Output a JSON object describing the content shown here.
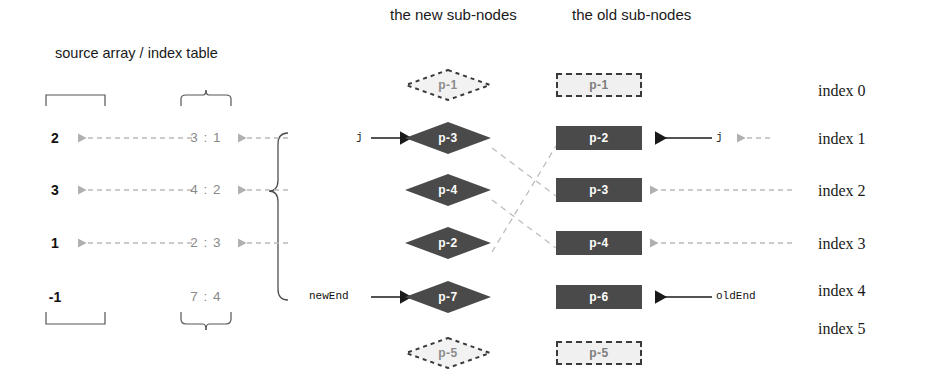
{
  "headers": {
    "new_sub_nodes": "the new sub-nodes",
    "old_sub_nodes": "the old sub-nodes",
    "source_index": "source array  /  index table"
  },
  "source_array": {
    "values": [
      "2",
      "3",
      "1",
      "-1"
    ]
  },
  "index_table": {
    "entries": [
      "3 : 1",
      "4 : 2",
      "2 : 3",
      "7 : 4"
    ]
  },
  "new_nodes": [
    {
      "label": "p-1",
      "state": "ghost"
    },
    {
      "label": "p-3",
      "state": "active"
    },
    {
      "label": "p-4",
      "state": "active"
    },
    {
      "label": "p-2",
      "state": "active"
    },
    {
      "label": "p-7",
      "state": "active"
    },
    {
      "label": "p-5",
      "state": "ghost"
    }
  ],
  "old_nodes": [
    {
      "label": "p-1",
      "state": "ghost"
    },
    {
      "label": "p-2",
      "state": "active"
    },
    {
      "label": "p-3",
      "state": "active"
    },
    {
      "label": "p-4",
      "state": "active"
    },
    {
      "label": "p-6",
      "state": "active"
    },
    {
      "label": "p-5",
      "state": "ghost"
    }
  ],
  "pointers": {
    "new_j": "j",
    "new_end": "newEnd",
    "old_j": "j",
    "old_end": "oldEnd"
  },
  "index_labels": [
    "index 0",
    "index 1",
    "index 2",
    "index 3",
    "index 4",
    "index 5"
  ],
  "colors": {
    "node_fill": "#4a4a4a",
    "node_text": "#ffffff",
    "ghost_text": "#8c8c8c",
    "ghost_fill": "#f0f0f0",
    "dashed_link": "#b9b9b9",
    "solid_arrow": "#1a1a1a",
    "muted_text": "#8a8a8a",
    "body_text": "#1a1a1a",
    "background": "#ffffff"
  }
}
